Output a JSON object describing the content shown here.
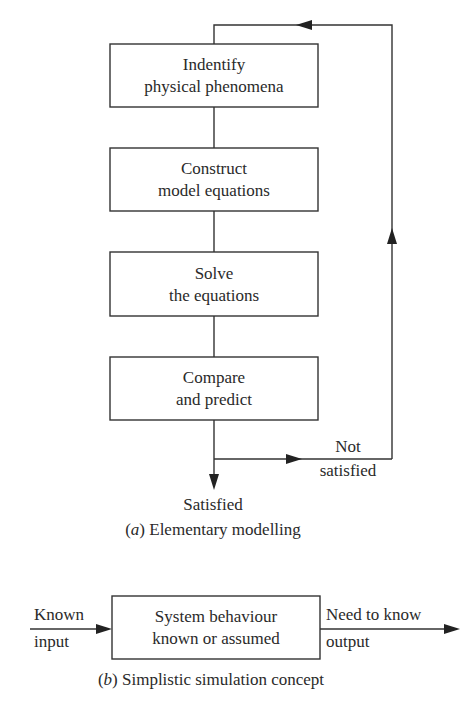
{
  "diagram_a": {
    "caption_prefix": "(a)",
    "caption_text": " Elementary modelling",
    "boxes": [
      {
        "line1": "Indentify",
        "line2": "physical phenomena"
      },
      {
        "line1": "Construct",
        "line2": "model equations"
      },
      {
        "line1": "Solve",
        "line2": "the equations"
      },
      {
        "line1": "Compare",
        "line2": "and predict"
      }
    ],
    "branch_satisfied": "Satisfied",
    "branch_not_satisfied_line1": "Not",
    "branch_not_satisfied_line2": "satisfied"
  },
  "diagram_b": {
    "caption_prefix": "(b)",
    "caption_text": " Simplistic simulation concept",
    "input_line1": "Known",
    "input_line2": "input",
    "box_line1": "System behaviour",
    "box_line2": "known or assumed",
    "output_line1": "Need to know",
    "output_line2": "output"
  }
}
